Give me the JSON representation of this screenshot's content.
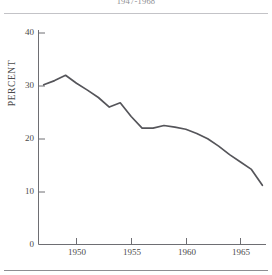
{
  "figure": {
    "title": "1947-1968",
    "background_color": "#ffffff",
    "line_color": "#55555a",
    "axis_color": "#6e6e73",
    "rule_color": "#b9b9bd"
  },
  "chart_data": {
    "type": "line",
    "title": "1947-1968",
    "xlabel": "",
    "ylabel": "PERCENT",
    "xlim": [
      1946.5,
      1967.5
    ],
    "ylim": [
      0,
      40
    ],
    "xticks": [
      1950,
      1955,
      1960,
      1965
    ],
    "xtick_labels": [
      "1950",
      "1955",
      "1960",
      "1965"
    ],
    "yticks": [
      0,
      10,
      20,
      30,
      40
    ],
    "ytick_labels": [
      "0",
      "10",
      "20",
      "30",
      "40"
    ],
    "grid": false,
    "legend": false,
    "series": [
      {
        "name": "Percent",
        "x": [
          1947,
          1948,
          1949,
          1950,
          1951,
          1952,
          1953,
          1954,
          1955,
          1956,
          1957,
          1958,
          1959,
          1960,
          1961,
          1962,
          1963,
          1964,
          1965,
          1966,
          1967
        ],
        "values": [
          30.2,
          31.0,
          32.0,
          30.5,
          29.2,
          27.8,
          26.0,
          26.8,
          24.2,
          22.0,
          22.0,
          22.5,
          22.2,
          21.8,
          21.0,
          20.0,
          18.6,
          17.0,
          15.6,
          14.2,
          11.2
        ]
      }
    ]
  },
  "axis": {
    "y_label_text": "PERCENT"
  }
}
